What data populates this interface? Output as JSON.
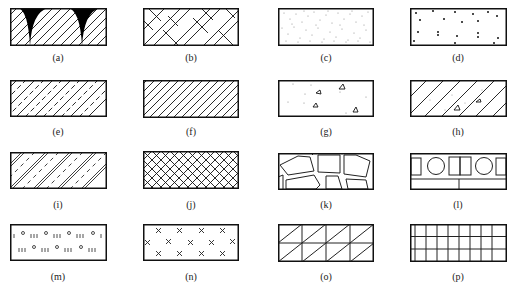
{
  "figure": {
    "panels": [
      {
        "id": "a",
        "label": "(a)",
        "pattern": "diagonal-hatch-with-black-cusps"
      },
      {
        "id": "b",
        "label": "(b)",
        "pattern": "herringbone-double-lines"
      },
      {
        "id": "c",
        "label": "(c)",
        "pattern": "fine-stipple"
      },
      {
        "id": "d",
        "label": "(d)",
        "pattern": "sparse-dots-and-small-marks"
      },
      {
        "id": "e",
        "label": "(e)",
        "pattern": "diagonal-hatch-alternating-dashed"
      },
      {
        "id": "f",
        "label": "(f)",
        "pattern": "diagonal-hatch"
      },
      {
        "id": "g",
        "label": "(g)",
        "pattern": "dots-and-triangles"
      },
      {
        "id": "h",
        "label": "(h)",
        "pattern": "wide-diagonal-hatch-with-dots-and-triangles"
      },
      {
        "id": "i",
        "label": "(i)",
        "pattern": "double-diagonal-lines-with-dashes"
      },
      {
        "id": "j",
        "label": "(j)",
        "pattern": "cross-hatch"
      },
      {
        "id": "k",
        "label": "(k)",
        "pattern": "irregular-stones"
      },
      {
        "id": "l",
        "label": "(l)",
        "pattern": "blocks-and-circles"
      },
      {
        "id": "m",
        "label": "(m)",
        "pattern": "circles-and-triple-ticks"
      },
      {
        "id": "n",
        "label": "(n)",
        "pattern": "scattered-crosses"
      },
      {
        "id": "o",
        "label": "(o)",
        "pattern": "grid-with-diagonals"
      },
      {
        "id": "p",
        "label": "(p)",
        "pattern": "rectangular-grid"
      }
    ]
  }
}
